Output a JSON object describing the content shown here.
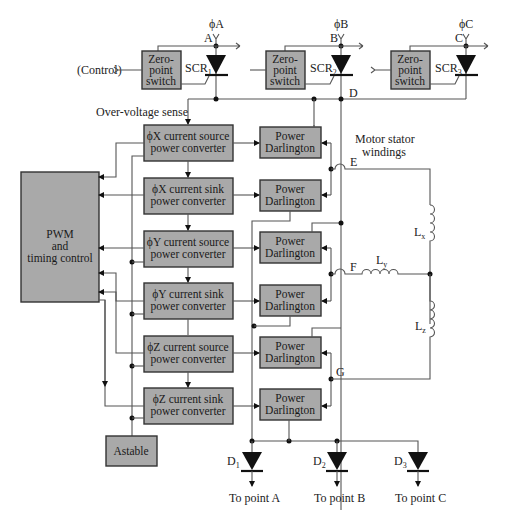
{
  "diagram": {
    "phases": [
      {
        "label": "ϕA",
        "node": "A",
        "scr": "SCR",
        "scr_sub": "1"
      },
      {
        "label": "ϕB",
        "node": "B",
        "scr": "SCR",
        "scr_sub": "2"
      },
      {
        "label": "ϕC",
        "node": "C",
        "scr": "SCR",
        "scr_sub": "3"
      }
    ],
    "zero_point_switch": {
      "line1": "Zero-",
      "line2": "point",
      "line3": "switch"
    },
    "control_label": "(Control)",
    "over_voltage_label": "Over-voltage sense",
    "node_D": "D",
    "node_E": "E",
    "node_F": "F",
    "node_G": "G",
    "pwm": {
      "line1": "PWM",
      "line2": "and",
      "line3": "timing control"
    },
    "converters": [
      {
        "line1": "ϕX current source",
        "line2": "power converter"
      },
      {
        "line1": "ϕX current sink",
        "line2": "power converter"
      },
      {
        "line1": "ϕY current source",
        "line2": "power converter"
      },
      {
        "line1": "ϕY current sink",
        "line2": "power converter"
      },
      {
        "line1": "ϕZ current source",
        "line2": "power converter"
      },
      {
        "line1": "ϕZ current sink",
        "line2": "power converter"
      }
    ],
    "darlington": {
      "line1": "Power",
      "line2": "Darlington"
    },
    "motor_label": {
      "line1": "Motor stator",
      "line2": "windings"
    },
    "inductors": [
      {
        "name": "L",
        "sub": "x"
      },
      {
        "name": "L",
        "sub": "y"
      },
      {
        "name": "L",
        "sub": "z"
      }
    ],
    "astable": "Astable",
    "diodes": [
      {
        "name": "D",
        "sub": "1",
        "dest": "To point A"
      },
      {
        "name": "D",
        "sub": "2",
        "dest": "To point B"
      },
      {
        "name": "D",
        "sub": "3",
        "dest": "To point C"
      }
    ]
  }
}
